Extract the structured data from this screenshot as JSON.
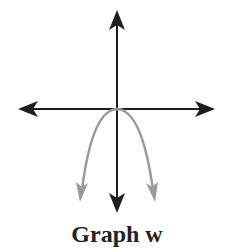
{
  "diagram": {
    "caption": "Graph w",
    "colors": {
      "axes": "#1e1e1e",
      "curve": "#9a9a9a",
      "caption": "#222222",
      "background": "#ffffff"
    },
    "axes": {
      "origin": [
        117,
        109
      ],
      "x_axis": {
        "x1": 18,
        "x2": 215,
        "arrows": "both"
      },
      "y_axis": {
        "y1": 10,
        "y2": 213,
        "arrows": "both"
      }
    },
    "curve": {
      "type": "parabola",
      "opens": "down",
      "vertex": [
        117,
        109
      ],
      "left_end": [
        80,
        202
      ],
      "right_end": [
        155,
        202
      ],
      "arrows": "both-ends"
    }
  }
}
